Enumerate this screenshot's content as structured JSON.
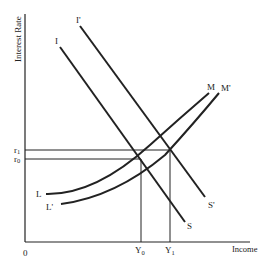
{
  "diagram": {
    "y_axis_label": "Interest Rate",
    "x_axis_label": "Income",
    "origin_label": "0",
    "curves": {
      "I": "I",
      "I_prime": "I'",
      "S": "S",
      "S_prime": "S'",
      "L": "L",
      "L_prime": "L'",
      "M": "M",
      "M_prime": "M'"
    },
    "ticks": {
      "r1": "r",
      "r1_sub": "1",
      "r0": "r",
      "r0_sub": "0",
      "Y0": "Y",
      "Y0_sub": "0",
      "Y1": "Y",
      "Y1_sub": "1"
    },
    "colors": {
      "line": "#222222",
      "background": "#ffffff"
    }
  }
}
